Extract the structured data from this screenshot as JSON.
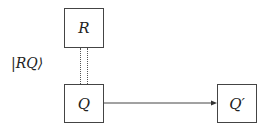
{
  "diagram": {
    "nodes": [
      {
        "id": "R",
        "label": "R"
      },
      {
        "id": "Q",
        "label": "Q"
      },
      {
        "id": "Qprime",
        "label": "Q′"
      }
    ],
    "entanglement_label": "|RQ⟩",
    "edges": [
      {
        "from": "R",
        "to": "Q",
        "style": "double-dotted",
        "meaning": "entangled"
      },
      {
        "from": "Q",
        "to": "Qprime",
        "style": "arrow"
      }
    ]
  }
}
